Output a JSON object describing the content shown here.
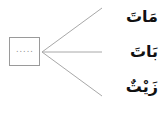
{
  "diagram": {
    "blank_placeholder": ".....",
    "words": [
      {
        "text": "مَاتَ"
      },
      {
        "text": "بَاتَ"
      },
      {
        "text": "زَيْتٌ"
      }
    ],
    "colors": {
      "line": "#a8a8a8",
      "box_border": "#9a9a9a",
      "text": "#111111"
    }
  }
}
